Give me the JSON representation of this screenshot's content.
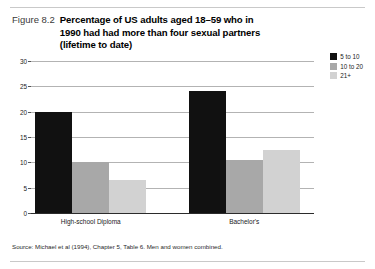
{
  "figure": {
    "number": "Figure 8.2",
    "title": "Percentage of US adults aged 18–59 who in 1990 had had more than four sexual partners (lifetime to date)",
    "source": "Source: Michael et al (1994), Chapter 5, Table 6. Men and women combined."
  },
  "colors": {
    "series_5_to_10": "#111111",
    "series_10_to_20": "#a8a8a8",
    "series_21_plus": "#d2d2d2",
    "gridline": "#b3b3b3",
    "axis": "#2b2b2b",
    "rule": "#c9c9c9"
  },
  "chart_data": {
    "type": "bar",
    "title": "Percentage of US adults aged 18–59 who in 1990 had had more than four sexual partners (lifetime to date)",
    "categories": [
      "High-school Diploma",
      "Bachelor's"
    ],
    "series": [
      {
        "name": "5 to 10",
        "values": [
          20,
          24
        ]
      },
      {
        "name": "10 to 20",
        "values": [
          10,
          10.5
        ]
      },
      {
        "name": "21+",
        "values": [
          6.5,
          12.5
        ]
      }
    ],
    "xlabel": "",
    "ylabel": "",
    "ylim": [
      0,
      30
    ],
    "yticks": [
      0,
      5,
      10,
      15,
      20,
      25,
      30
    ],
    "ytick_labels": [
      "0",
      "5",
      "10",
      "15",
      "20",
      "25",
      "30"
    ],
    "grid": true,
    "legend_position": "top-right",
    "annotations": [
      "Source: Michael et al (1994), Chapter 5, Table 6. Men and women combined."
    ]
  }
}
